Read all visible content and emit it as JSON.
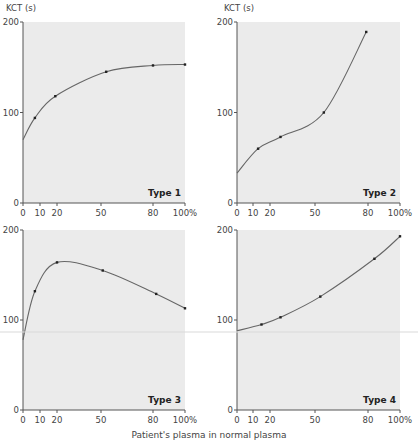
{
  "chart_data": [
    {
      "type": "line",
      "title": "Type 1",
      "ylabel": "KCT (s)",
      "xlabel": "Patient's plasma in normal plasma",
      "x_ticks": [
        "0",
        "10",
        "20",
        "50",
        "80",
        "100%"
      ],
      "y_ticks": [
        "0",
        "100",
        "200"
      ],
      "ylim": [
        0,
        200
      ],
      "xlim": [
        0,
        100
      ],
      "points": [
        [
          0,
          70
        ],
        [
          7,
          94
        ],
        [
          19,
          118
        ],
        [
          53,
          145
        ],
        [
          80,
          152
        ],
        [
          100,
          153
        ]
      ],
      "grid": false
    },
    {
      "type": "line",
      "title": "Type 2",
      "ylabel": "KCT (s)",
      "xlabel": "Patient's plasma in normal plasma",
      "x_ticks": [
        "0",
        "10",
        "20",
        "50",
        "80",
        "100%"
      ],
      "y_ticks": [
        "0",
        "100",
        "200"
      ],
      "ylim": [
        0,
        200
      ],
      "xlim": [
        0,
        100
      ],
      "points": [
        [
          0,
          33
        ],
        [
          13,
          60
        ],
        [
          27,
          73
        ],
        [
          55,
          100
        ],
        [
          79,
          189
        ]
      ],
      "grid": false
    },
    {
      "type": "line",
      "title": "Type 3",
      "xlabel": "Patient's plasma in normal plasma",
      "x_ticks": [
        "0",
        "10",
        "20",
        "50",
        "80",
        "100%"
      ],
      "y_ticks": [
        "0",
        "100",
        "200"
      ],
      "ylim": [
        0,
        200
      ],
      "xlim": [
        0,
        100
      ],
      "points": [
        [
          0,
          78
        ],
        [
          7,
          132
        ],
        [
          20,
          164
        ],
        [
          51,
          155
        ],
        [
          82,
          129
        ],
        [
          100,
          113
        ]
      ],
      "grid": false
    },
    {
      "type": "line",
      "title": "Type 4",
      "xlabel": "Patient's plasma in normal plasma",
      "x_ticks": [
        "0",
        "10",
        "20",
        "50",
        "80",
        "100%"
      ],
      "y_ticks": [
        "0",
        "100",
        "200"
      ],
      "ylim": [
        0,
        200
      ],
      "xlim": [
        0,
        100
      ],
      "points": [
        [
          0,
          88
        ],
        [
          15,
          95
        ],
        [
          27,
          103
        ],
        [
          53,
          126
        ],
        [
          84,
          168
        ],
        [
          100,
          193
        ]
      ],
      "grid": false
    }
  ],
  "labels": {
    "y_axis_left": "KCT (s)",
    "y_axis_right": "KCT (s)",
    "x_axis": "Patient's plasma in normal plasma"
  },
  "colors": {
    "plot_bg": "#ebebeb",
    "axis": "#555555",
    "curve": "#666666",
    "point": "#222222"
  }
}
